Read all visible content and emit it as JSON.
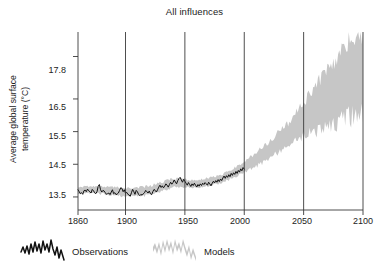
{
  "chart_data": {
    "type": "line",
    "title": "All influences",
    "xlabel": "",
    "ylabel": "Average global surface temperature (°C)",
    "ylabel_line1": "Average global surface",
    "ylabel_line2": "temperature (°C)",
    "xlim": [
      1860,
      2100
    ],
    "ylim": [
      13.1,
      18.55
    ],
    "xticks": [
      1860,
      1900,
      1950,
      2000,
      2050,
      2100
    ],
    "xticklabels": [
      "1860",
      "1900",
      "1950",
      "2000",
      "2050",
      "2100"
    ],
    "yticks": [
      13.5,
      14.5,
      15.5,
      16.5,
      17.8
    ],
    "yticklabels": [
      "13.5",
      "14.5",
      "15.5",
      "16.5",
      "17.8"
    ],
    "grid": "vertical-only",
    "legend_position": "below-axes-left",
    "series": [
      {
        "name": "Observations",
        "style": "line",
        "color": "#111111",
        "x_start": 1860,
        "x_end": 2000,
        "values": [
          13.72,
          13.66,
          13.6,
          13.63,
          13.58,
          13.69,
          13.71,
          13.66,
          13.74,
          13.69,
          13.66,
          13.62,
          13.73,
          13.69,
          13.63,
          13.6,
          13.66,
          13.83,
          13.88,
          13.72,
          13.65,
          13.7,
          13.68,
          13.63,
          13.58,
          13.6,
          13.62,
          13.57,
          13.65,
          13.72,
          13.6,
          13.63,
          13.57,
          13.59,
          13.62,
          13.7,
          13.78,
          13.76,
          13.66,
          13.72,
          13.61,
          13.64,
          13.58,
          13.56,
          13.52,
          13.63,
          13.73,
          13.66,
          13.58,
          13.7,
          13.66,
          13.58,
          13.54,
          13.58,
          13.55,
          13.6,
          13.63,
          13.7,
          13.66,
          13.62,
          13.68,
          13.6,
          13.57,
          13.66,
          13.73,
          13.7,
          13.65,
          13.72,
          13.8,
          13.86,
          13.79,
          13.84,
          13.78,
          13.83,
          13.9,
          13.86,
          13.8,
          13.88,
          13.95,
          13.89,
          13.94,
          14.02,
          13.96,
          13.9,
          14.0,
          14.06,
          14.1,
          14.02,
          13.95,
          14.04,
          13.98,
          13.92,
          13.86,
          13.94,
          13.88,
          13.82,
          13.9,
          13.85,
          13.92,
          13.86,
          13.8,
          13.88,
          13.83,
          13.9,
          13.85,
          13.92,
          13.88,
          13.94,
          13.9,
          13.86,
          13.95,
          13.9,
          13.84,
          13.92,
          13.98,
          13.93,
          14.0,
          13.95,
          14.03,
          13.97,
          14.05,
          14.0,
          14.08,
          14.14,
          14.07,
          14.15,
          14.1,
          14.18,
          14.12,
          14.22,
          14.16,
          14.24,
          14.19,
          14.28,
          14.22,
          14.31,
          14.26,
          14.36,
          14.3,
          14.4,
          14.35
        ]
      },
      {
        "name": "Models",
        "style": "band",
        "color": "#c6c6c6",
        "x_start": 1860,
        "x_end": 2100,
        "band_description": "Grey envelope of model spread; narrow (~0.15 °C) over the observational period, widening steeply after 2000 to roughly 2.9 °C at 2100.",
        "band_points": [
          {
            "year": 1860,
            "low": 13.62,
            "high": 13.8
          },
          {
            "year": 1880,
            "low": 13.6,
            "high": 13.82
          },
          {
            "year": 1900,
            "low": 13.52,
            "high": 13.76
          },
          {
            "year": 1920,
            "low": 13.56,
            "high": 13.82
          },
          {
            "year": 1940,
            "low": 13.8,
            "high": 14.06
          },
          {
            "year": 1960,
            "low": 13.78,
            "high": 14.0
          },
          {
            "year": 1980,
            "low": 13.92,
            "high": 14.16
          },
          {
            "year": 2000,
            "low": 14.26,
            "high": 14.55
          },
          {
            "year": 2010,
            "low": 14.45,
            "high": 14.85
          },
          {
            "year": 2020,
            "low": 14.65,
            "high": 15.15
          },
          {
            "year": 2030,
            "low": 14.92,
            "high": 15.5
          },
          {
            "year": 2040,
            "low": 15.15,
            "high": 15.85
          },
          {
            "year": 2050,
            "low": 15.38,
            "high": 16.35
          },
          {
            "year": 2060,
            "low": 15.55,
            "high": 16.85
          },
          {
            "year": 2070,
            "low": 15.72,
            "high": 17.3
          },
          {
            "year": 2080,
            "low": 15.88,
            "high": 17.8
          },
          {
            "year": 2090,
            "low": 16.02,
            "high": 18.25
          },
          {
            "year": 2100,
            "low": 16.1,
            "high": 18.5
          }
        ]
      }
    ]
  },
  "legend": {
    "observations_label": "Observations",
    "models_label": "Models"
  },
  "colors": {
    "observations": "#111111",
    "models": "#c6c6c6",
    "axis": "#3a3a3a",
    "text": "#222222"
  }
}
